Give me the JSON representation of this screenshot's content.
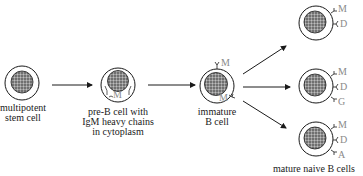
{
  "diagram": {
    "type": "B cell development flow",
    "stages": [
      {
        "id": "stem",
        "label_lines": [
          "multipotent",
          "stem cell"
        ]
      },
      {
        "id": "preB",
        "label_lines": [
          "pre-B cell with",
          "IgM heavy chains",
          "in cytoplasm"
        ],
        "inner_label": "M"
      },
      {
        "id": "immature",
        "label_lines": [
          "immature",
          "B cell"
        ],
        "surface_labels": [
          "M",
          "M"
        ]
      },
      {
        "id": "mature1",
        "surface_labels": [
          "M",
          "D"
        ]
      },
      {
        "id": "mature2",
        "surface_labels": [
          "M",
          "D",
          "G"
        ]
      },
      {
        "id": "mature3",
        "surface_labels": [
          "M",
          "D",
          "A"
        ]
      }
    ],
    "mature_group_label": "mature naive B cells",
    "colors": {
      "ink": "#1a1a1a",
      "receptor_label": "#8a8a8a",
      "nucleus": "#6e6e6e"
    }
  }
}
